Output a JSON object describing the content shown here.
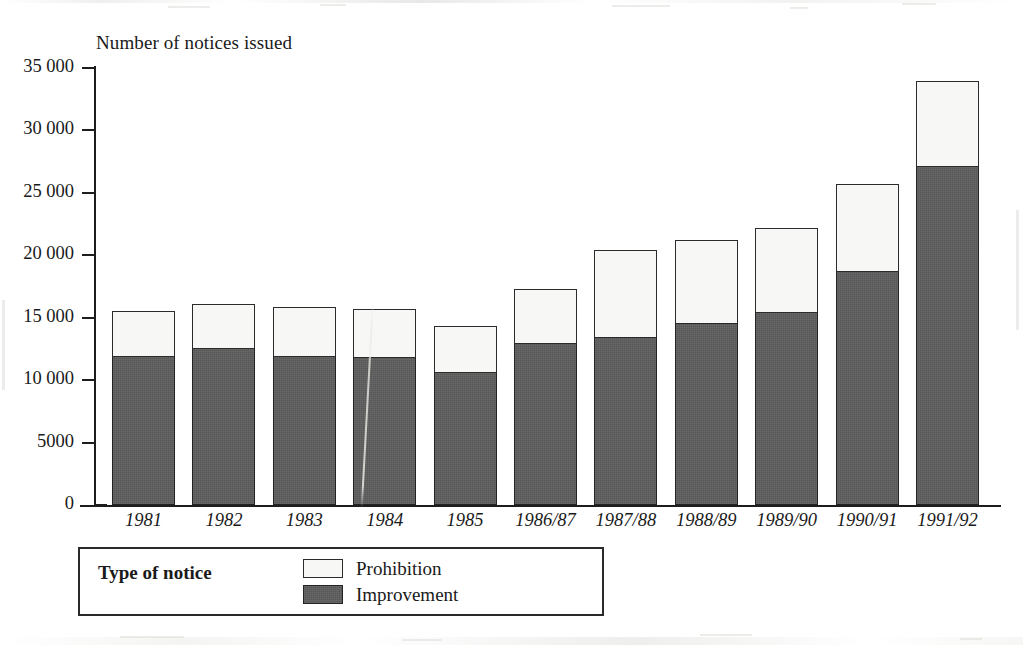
{
  "chart_data": {
    "type": "bar",
    "title": "",
    "subtitle": "",
    "ylabel": "Number of notices issued",
    "xlabel": "",
    "stacked": true,
    "grid": false,
    "legend_position": "bottom-left",
    "legend_title": "Type of notice",
    "ylim": [
      0,
      35000
    ],
    "yticks": [
      0,
      5000,
      10000,
      15000,
      20000,
      25000,
      30000,
      35000
    ],
    "ytick_labels": [
      "0",
      "5000",
      "10 000",
      "15 000",
      "20 000",
      "25 000",
      "30 000",
      "35 000"
    ],
    "categories": [
      "1981",
      "1982",
      "1983",
      "1984",
      "1985",
      "1986/87",
      "1987/88",
      "1988/89",
      "1989/90",
      "1990/91",
      "1991/92"
    ],
    "series": [
      {
        "name": "Improvement",
        "color": "#575757",
        "values": [
          12000,
          12600,
          12000,
          11900,
          10700,
          13000,
          13500,
          14600,
          15500,
          18800,
          27200
        ]
      },
      {
        "name": "Prohibition",
        "color": "#f7f7f5",
        "values": [
          3500,
          3500,
          3900,
          3800,
          3600,
          4300,
          6900,
          6600,
          6700,
          6900,
          6800
        ]
      }
    ],
    "totals": [
      15500,
      16100,
      15900,
      15700,
      14300,
      17300,
      20400,
      21200,
      22200,
      25700,
      34000
    ]
  },
  "legend": {
    "title": "Type of notice",
    "entries": [
      {
        "label": "Prohibition",
        "swatch": "prohibition"
      },
      {
        "label": "Improvement",
        "swatch": "improvement"
      }
    ]
  },
  "colors": {
    "improvement": "#575757",
    "prohibition": "#f7f7f5",
    "axis": "#1d1d1d",
    "background": "#ffffff"
  }
}
